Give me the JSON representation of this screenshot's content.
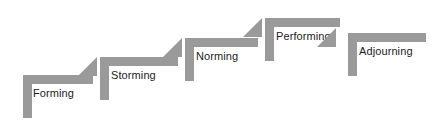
{
  "diagram": {
    "bar_color": "#9a9a9a",
    "label_color": "#1c1c1c",
    "background_color": "#ffffff",
    "width": 439,
    "height": 132,
    "stages": [
      {
        "id": "forming",
        "label": "Forming",
        "order": 1,
        "arrow": false,
        "geometry": {
          "top_x": 23,
          "top_y": 75,
          "top_w": 70,
          "top_h": 9,
          "leg_x": 23,
          "leg_y": 75,
          "leg_w": 9,
          "leg_h": 43,
          "label_x": 33,
          "label_y": 87,
          "arrow_x": 0,
          "arrow_y": 0,
          "arrow_w": 0,
          "arrow_h": 0
        }
      },
      {
        "id": "storming",
        "label": "Storming",
        "order": 2,
        "arrow": true,
        "geometry": {
          "top_x": 100,
          "top_y": 57,
          "top_w": 78,
          "top_h": 9,
          "leg_x": 100,
          "leg_y": 57,
          "leg_w": 9,
          "leg_h": 43,
          "label_x": 111,
          "label_y": 69,
          "arrow_x": 78,
          "arrow_y": 57,
          "arrow_w": 19,
          "arrow_h": 19
        }
      },
      {
        "id": "norming",
        "label": "Norming",
        "order": 3,
        "arrow": true,
        "geometry": {
          "top_x": 185,
          "top_y": 38,
          "top_w": 73,
          "top_h": 9,
          "leg_x": 185,
          "leg_y": 38,
          "leg_w": 9,
          "leg_h": 43,
          "label_x": 196,
          "label_y": 50,
          "arrow_x": 163,
          "arrow_y": 38,
          "arrow_w": 19,
          "arrow_h": 19
        }
      },
      {
        "id": "performing",
        "label": "Performing",
        "order": 4,
        "arrow": true,
        "geometry": {
          "top_x": 265,
          "top_y": 18,
          "top_w": 75,
          "top_h": 9,
          "leg_x": 265,
          "leg_y": 18,
          "leg_w": 9,
          "leg_h": 43,
          "label_x": 276,
          "label_y": 30,
          "arrow_x": 243,
          "arrow_y": 18,
          "arrow_w": 19,
          "arrow_h": 19
        }
      },
      {
        "id": "adjourning",
        "label": "Adjourning",
        "order": 5,
        "arrow": true,
        "geometry": {
          "top_x": 348,
          "top_y": 33,
          "top_w": 78,
          "top_h": 9,
          "leg_x": 348,
          "leg_y": 33,
          "leg_w": 9,
          "leg_h": 43,
          "label_x": 359,
          "label_y": 45,
          "arrow_x": 317,
          "arrow_y": 28,
          "arrow_w": 19,
          "arrow_h": 19
        }
      }
    ]
  }
}
